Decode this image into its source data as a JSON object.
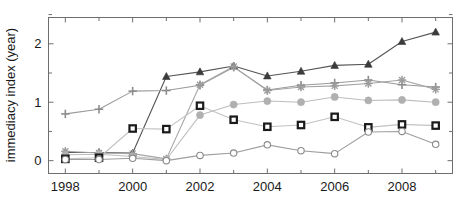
{
  "chart_data": {
    "type": "line",
    "title": "",
    "xlabel": "",
    "ylabel": "immediacy index (year)",
    "xlim": [
      1997.5,
      2009.5
    ],
    "ylim": [
      -0.22,
      2.45
    ],
    "grid": false,
    "legend": "none",
    "x": [
      1998,
      1999,
      2000,
      2001,
      2002,
      2003,
      2004,
      2005,
      2006,
      2007,
      2008,
      2009
    ],
    "x_tick_labels": [
      "1998",
      "",
      "2000",
      "",
      "2002",
      "",
      "2004",
      "",
      "2006",
      "",
      "2008",
      ""
    ],
    "x_major_labels": [
      "1998",
      "2000",
      "2002",
      "2004",
      "2006",
      "2008"
    ],
    "y_tick_values": [
      0,
      0.5,
      1,
      1.5,
      2,
      2.5
    ],
    "y_tick_labels": [
      "0",
      "",
      "1",
      "",
      "2",
      ""
    ],
    "y_major_labels": [
      "0",
      "1",
      "2"
    ],
    "series": [
      {
        "name": "series-triangle-dark",
        "marker": "triangle",
        "color": "#3b3b3b",
        "line_color": "#555555",
        "values": [
          0.14,
          0.14,
          0.13,
          1.44,
          1.52,
          1.62,
          1.45,
          1.53,
          1.63,
          1.65,
          2.04,
          2.2
        ]
      },
      {
        "name": "series-plus-gray",
        "marker": "plus",
        "color": "#8c8c8c",
        "line_color": "#9a9a9a",
        "values": [
          0.8,
          0.88,
          1.19,
          1.2,
          1.29,
          1.6,
          1.21,
          1.29,
          1.33,
          1.38,
          1.3,
          1.26
        ]
      },
      {
        "name": "series-star-gray",
        "marker": "star",
        "color": "#9c9c9c",
        "line_color": "#a5a5a5",
        "values": [
          0.16,
          0.13,
          0.12,
          0.03,
          1.3,
          1.61,
          1.2,
          1.26,
          1.28,
          1.32,
          1.38,
          1.22
        ]
      },
      {
        "name": "series-circle-filled",
        "marker": "circle-filled",
        "color": "#b0b0b0",
        "line_color": "#bdbdbd",
        "values": [
          0.1,
          0.11,
          0.07,
          0.02,
          0.78,
          0.96,
          1.02,
          1.0,
          1.09,
          1.03,
          1.04,
          1.0
        ]
      },
      {
        "name": "series-square-black",
        "marker": "square",
        "color": "#1a1a1a",
        "line_color": "#c2c2c2",
        "values": [
          0.03,
          0.05,
          0.55,
          0.54,
          0.94,
          0.7,
          0.58,
          0.61,
          0.75,
          0.57,
          0.62,
          0.6
        ]
      },
      {
        "name": "series-circle-open",
        "marker": "circle-open",
        "color": "#8a8a8a",
        "line_color": "#9e9e9e",
        "values": [
          0.02,
          0.02,
          0.04,
          0.0,
          0.09,
          0.13,
          0.27,
          0.17,
          0.12,
          0.49,
          0.5,
          0.28
        ]
      }
    ]
  },
  "axes": {
    "ylabel": "immediacy index (year)"
  }
}
